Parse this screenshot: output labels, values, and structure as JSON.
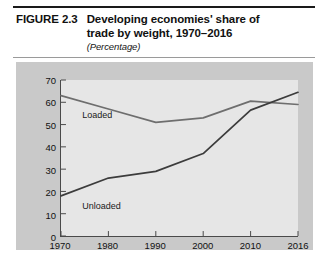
{
  "figure": {
    "label": "FIGURE 2.3",
    "title_line1": "Developing economies' share of",
    "title_line2": "trade by weight, 1970–2016",
    "subtitle": "(Percentage)"
  },
  "colors": {
    "panel_background": "#c9c9c9",
    "plot_background": "#e6e6e6",
    "axis": "#4a4a4a",
    "line_loaded": "#6e6e6e",
    "line_unloaded": "#3c3c3c",
    "text": "#111111",
    "rule_top": "#1a1a1a",
    "rule_bottom": "#9a9a9a"
  },
  "chart_data": {
    "type": "line",
    "title": "Developing economies' share of trade by weight, 1970–2016",
    "subtitle": "(Percentage)",
    "xlabel": "",
    "ylabel": "",
    "categories": [
      "1970",
      "1980",
      "1990",
      "2000",
      "2010",
      "2016"
    ],
    "x": [
      1970,
      1980,
      1990,
      2000,
      2010,
      2016
    ],
    "xlim": [
      1970,
      2016
    ],
    "ylim": [
      0,
      70
    ],
    "yticks": [
      0,
      10,
      20,
      30,
      40,
      50,
      60,
      70
    ],
    "xticks": [
      "1970",
      "1980",
      "1990",
      "2000",
      "2010",
      "2016"
    ],
    "grid": false,
    "legend": "in-plot-labels",
    "series": [
      {
        "name": "Loaded",
        "values": [
          63,
          57,
          51,
          53,
          60.5,
          59
        ],
        "color": "#6e6e6e",
        "label_x": 1974.5,
        "label_y": 54.5
      },
      {
        "name": "Unloaded",
        "values": [
          18,
          26,
          29,
          37,
          56.5,
          64.5
        ],
        "color": "#3c3c3c",
        "label_x": 1974.5,
        "label_y": 13.5
      }
    ]
  }
}
